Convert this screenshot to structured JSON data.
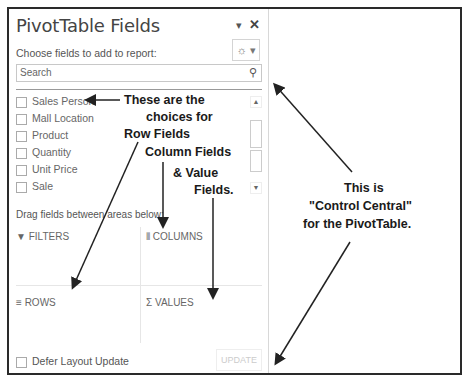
{
  "panel": {
    "title": "PivotTable Fields",
    "dropdown_icon": "▾",
    "close_icon": "✕",
    "choose_label": "Choose fields to add to report:",
    "tools_icon": "☼ ▾",
    "search_placeholder": "Search",
    "search_icon": "⚲",
    "fields": [
      {
        "label": "Sales Person",
        "checked": false
      },
      {
        "label": "Mall Location",
        "checked": false
      },
      {
        "label": "Product",
        "checked": false
      },
      {
        "label": "Quantity",
        "checked": false
      },
      {
        "label": "Unit Price",
        "checked": false
      },
      {
        "label": "Sale",
        "checked": false
      }
    ],
    "scroll_up": "▲",
    "scroll_down": "▼",
    "drag_label": "Drag fields between areas below:",
    "areas": {
      "filters": {
        "icon": "▼",
        "label": "FILTERS"
      },
      "columns": {
        "icon": "⦀",
        "label": "COLUMNS"
      },
      "rows": {
        "icon": "≡",
        "label": "ROWS"
      },
      "values": {
        "icon": "Σ",
        "label": "VALUES"
      }
    },
    "defer_label": "Defer Layout Update",
    "update_label": "UPDATE"
  },
  "annotations": {
    "left_note_lines": [
      "These are the",
      "choices for",
      "Row Fields",
      "Column Fields",
      "& Value",
      "Fields."
    ],
    "right_note_lines": [
      "This is",
      "\"Control Central\"",
      "for the PivotTable."
    ]
  }
}
